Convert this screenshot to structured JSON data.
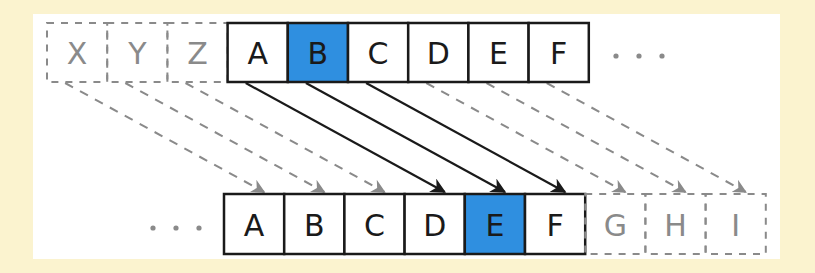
{
  "diagram": {
    "colors": {
      "background": "#fbf3cf",
      "panel": "#ffffff",
      "highlight": "#2f8fe0",
      "solid": "#1a1a1a",
      "ghost": "#8a8a8a"
    },
    "top_row": {
      "ghost_cells": [
        "X",
        "Y",
        "Z"
      ],
      "cells": [
        "A",
        "B",
        "C",
        "D",
        "E",
        "F"
      ],
      "highlight": "B",
      "ellipsis": "· · ·"
    },
    "bottom_row": {
      "ellipsis": "· · ·",
      "cells": [
        "A",
        "B",
        "C",
        "D",
        "E",
        "F"
      ],
      "ghost_cells": [
        "G",
        "H",
        "I"
      ],
      "highlight": "E"
    },
    "arrows": {
      "solid": [
        [
          "A",
          "D"
        ],
        [
          "B",
          "E"
        ],
        [
          "C",
          "F"
        ]
      ],
      "dashed": [
        [
          "X",
          "A"
        ],
        [
          "Y",
          "B"
        ],
        [
          "Z",
          "C"
        ],
        [
          "D",
          "G"
        ],
        [
          "E",
          "H"
        ],
        [
          "F",
          "I"
        ]
      ]
    }
  }
}
